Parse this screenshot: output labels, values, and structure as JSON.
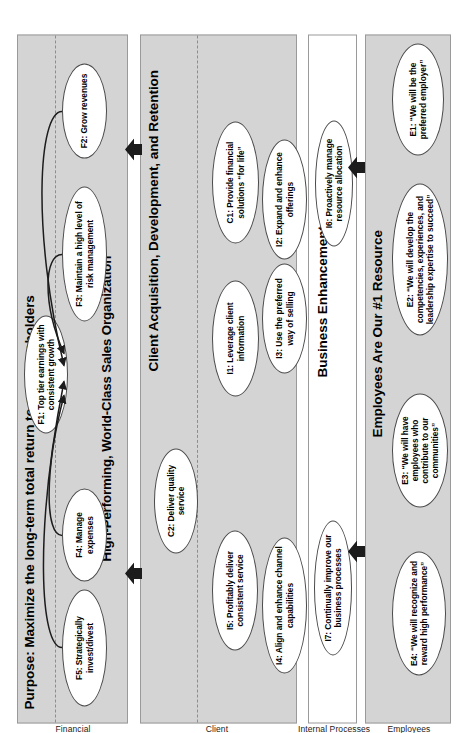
{
  "diagram": {
    "type": "strategy-map",
    "orientation": "rotated-90-ccw",
    "colors": {
      "band_fill": "#d4d4d4",
      "band_fill_alt": "#ffffff",
      "band_border": "#9a9a9a",
      "node_fill": "#ffffff",
      "node_border": "#4a4a4a",
      "arrow": "#1c1c1c",
      "divider": "#8d8d8d"
    }
  },
  "perspectives": [
    {
      "id": "financial",
      "label": "Financial",
      "title": "Purpose: Maximize the long-term total return to our shareholders"
    },
    {
      "id": "client",
      "label": "Client",
      "title": "High-Performing, World-Class Sales Organization"
    },
    {
      "id": "internal",
      "label": "Internal Processes",
      "title": "Client Acquisition, Development, and Retention"
    },
    {
      "id": "employees",
      "label": "Employees",
      "title": "Business Enhancement"
    }
  ],
  "band_titles": {
    "purpose": "Purpose: Maximize the long-term total return to our shareholders",
    "sales_org": "High-Performing, World-Class Sales Organization",
    "client_acq": "Client Acquisition, Development, and Retention",
    "business_enh": "Business Enhancement",
    "employees_res": "Employees Are Our #1 Resource"
  },
  "row_labels": {
    "financial": "Financial",
    "client": "Client",
    "internal_processes": "Internal Processes",
    "employees": "Employees"
  },
  "nodes": {
    "f1": "F1: Top tier earnings with consistent growth",
    "f2": "F2: Grow revenues",
    "f3": "F3: Maintain a high level of risk management",
    "f4": "F4: Manage expenses",
    "f5": "F5: Strategically invest/divest",
    "c1": "C1: Provide financial solutions “for life”",
    "c2": "C2: Deliver quality service",
    "i1": "I1: Leverage client information",
    "i2": "I2: Expand and enhance offerings",
    "i3": "I3: Use the preferred way of selling",
    "i4": "I4: Align and enhance channel capabilities",
    "i5": "I5: Profitably deliver consistent service",
    "i6": "I6: Proactively manage resource allocation",
    "i7": "I7: Continually improve our business processes",
    "e1": "E1: “We will be the preferred employer”",
    "e2": "E2: “We will develop the competencies, experiences, and leadership expertise to succeed”",
    "e3": "E3: “We will have employees who contribute to our communities”",
    "e4": "E4: “We will recognize and reward high performance”"
  },
  "connectors": [
    {
      "from": "f2",
      "to": "f1",
      "style": "curved-arrow"
    },
    {
      "from": "f3",
      "to": "f1",
      "style": "curved-arrow"
    },
    {
      "from": "f4",
      "to": "f1",
      "style": "curved-arrow"
    },
    {
      "from": "f5",
      "to": "f1",
      "style": "curved-arrow"
    }
  ],
  "block_arrows": [
    {
      "from": "client-band",
      "to": "financial-band",
      "direction": "up"
    },
    {
      "from": "client-band",
      "to": "financial-band",
      "direction": "up"
    },
    {
      "from": "employees-band",
      "to": "internal-band",
      "direction": "up"
    },
    {
      "from": "employees-band",
      "to": "internal-band",
      "direction": "up"
    }
  ]
}
